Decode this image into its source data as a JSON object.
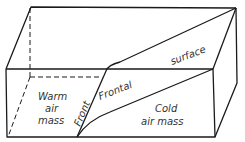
{
  "diagram": {
    "labels": {
      "warm_line1": "Warm",
      "warm_line2": "air",
      "warm_line3": "mass",
      "front": "Front",
      "frontal": "Frontal",
      "surface": "surface",
      "cold_line1": "Cold",
      "cold_line2": "air mass"
    },
    "colors": {
      "stroke": "#1a1a1a",
      "text": "#333333",
      "background": "#ffffff"
    }
  }
}
